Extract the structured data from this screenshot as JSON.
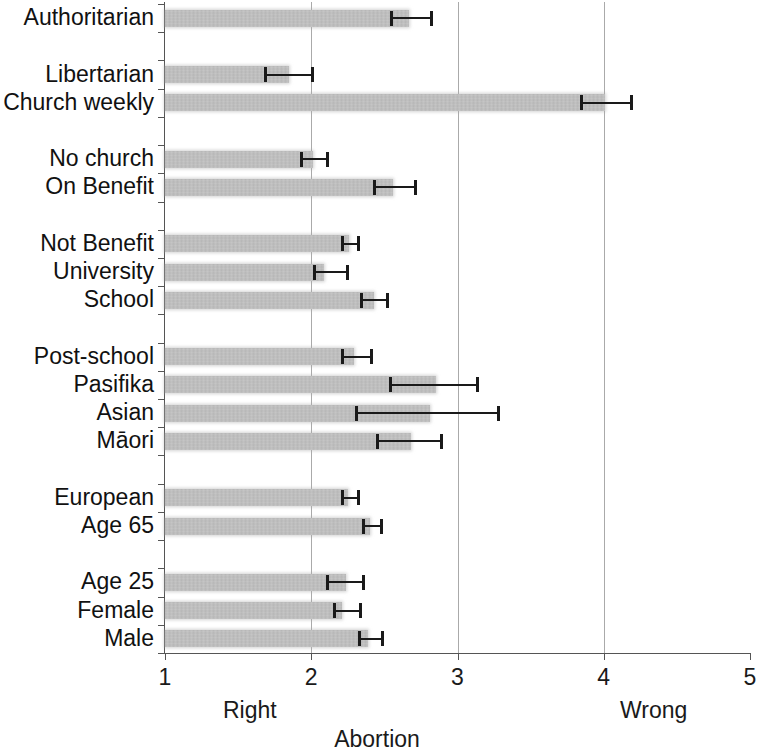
{
  "chart_data": {
    "type": "bar",
    "orientation": "horizontal",
    "title": "",
    "xlabel": "Abortion",
    "ylabel": "",
    "xlim": [
      1,
      5
    ],
    "xticks": [
      1,
      2,
      3,
      4
    ],
    "xtick_labels": [
      "1",
      "2",
      "3",
      "4",
      "5"
    ],
    "xticks_all": [
      1,
      2,
      3,
      4,
      5
    ],
    "gridlines": [
      2,
      3,
      4
    ],
    "grid": true,
    "legend": null,
    "scale_anchor_low": "Right",
    "scale_anchor_high": "Wrong",
    "error_bar_type": "confidence interval",
    "categories": [
      "Authoritarian",
      "Libertarian",
      "Church weekly",
      "No church",
      "On Benefit",
      "Not Benefit",
      "University",
      "School",
      "Post-school",
      "Pasifika",
      "Asian",
      "Māori",
      "European",
      "Age 65",
      "Age 25",
      "Female",
      "Male"
    ],
    "values": [
      2.67,
      1.85,
      4.01,
      2.01,
      2.56,
      2.26,
      2.09,
      2.43,
      2.29,
      2.85,
      2.81,
      2.68,
      2.25,
      2.4,
      2.24,
      2.21,
      2.39
    ],
    "ci_low": [
      2.54,
      1.68,
      3.84,
      1.92,
      2.42,
      2.2,
      2.01,
      2.33,
      2.2,
      2.53,
      2.3,
      2.44,
      2.2,
      2.35,
      2.1,
      2.15,
      2.32
    ],
    "ci_high": [
      2.83,
      2.02,
      4.2,
      2.12,
      2.72,
      2.33,
      2.26,
      2.53,
      2.42,
      3.15,
      3.29,
      2.9,
      2.33,
      2.49,
      2.37,
      2.35,
      2.5
    ],
    "group_breaks_after": [
      1,
      3,
      5,
      8,
      12,
      14
    ],
    "colors": {
      "bar_fill": "#a8a8a8",
      "error_bar": "#1a1a1a",
      "gridline": "#aaaaaa",
      "axis": "#555555",
      "text": "#1a1a1a",
      "background": "#ffffff"
    }
  }
}
